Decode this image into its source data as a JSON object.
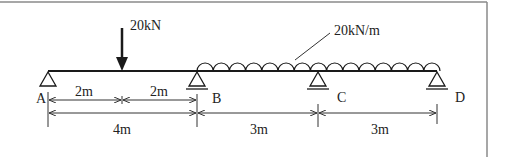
{
  "diagram": {
    "type": "continuous-beam",
    "colors": {
      "line": "#1a1a1a",
      "border": "#8a8a8a",
      "dim": "#333333",
      "background": "#ffffff"
    },
    "point_load": {
      "label": "20kN",
      "position_m": 2
    },
    "distributed_load": {
      "label": "20kN/m",
      "from": "B",
      "to": "D"
    },
    "supports": [
      {
        "label": "A",
        "type": "pin"
      },
      {
        "label": "B",
        "type": "roller"
      },
      {
        "label": "C",
        "type": "roller"
      },
      {
        "label": "D",
        "type": "roller"
      }
    ],
    "dimensions_top": [
      {
        "label": "2m"
      },
      {
        "label": "2m"
      }
    ],
    "dimensions_bottom": [
      {
        "label": "4m"
      },
      {
        "label": "3m"
      },
      {
        "label": "3m"
      }
    ]
  }
}
